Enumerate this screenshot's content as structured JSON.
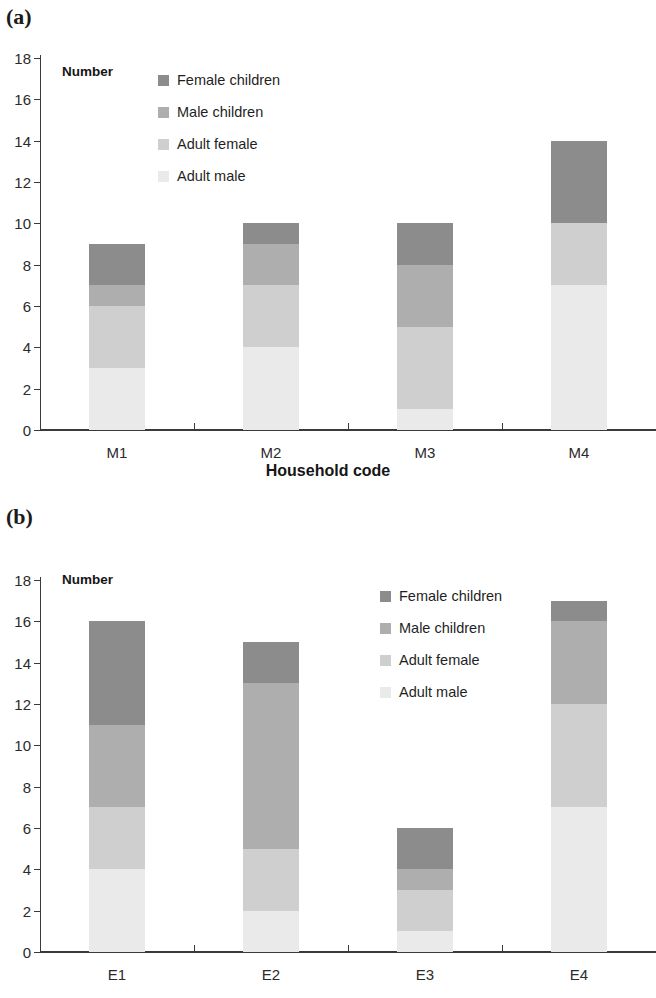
{
  "figure": {
    "panels": [
      {
        "tag": "(a)",
        "axis_title": "Household code",
        "number_label": "Number"
      },
      {
        "tag": "(b)",
        "axis_title": "Household code",
        "number_label": "Number"
      }
    ],
    "legend": [
      {
        "label": "Female children",
        "color": "#8c8c8c",
        "key": "fc"
      },
      {
        "label": "Male children",
        "color": "#aeaeae",
        "key": "mc"
      },
      {
        "label": "Adult female",
        "color": "#cfcfcf",
        "key": "af"
      },
      {
        "label": "Adult male",
        "color": "#eaeaea",
        "key": "am"
      }
    ],
    "y_ticks": [
      "0",
      "2",
      "4",
      "6",
      "8",
      "10",
      "12",
      "14",
      "16",
      "18"
    ]
  },
  "chart_data": [
    {
      "type": "bar",
      "subplot": "(a)",
      "stacked": true,
      "title": "",
      "xlabel": "Household code",
      "ylabel": "Number",
      "ylim": [
        0,
        18
      ],
      "ytick_step": 2,
      "grid": false,
      "legend_position": "inside top-left",
      "categories": [
        "M1",
        "M2",
        "M3",
        "M4"
      ],
      "series": [
        {
          "name": "Adult male",
          "color": "#eaeaea",
          "values": [
            3,
            4,
            1,
            7
          ]
        },
        {
          "name": "Adult female",
          "color": "#cfcfcf",
          "values": [
            3,
            3,
            4,
            3
          ]
        },
        {
          "name": "Male children",
          "color": "#aeaeae",
          "values": [
            1,
            2,
            3,
            0
          ]
        },
        {
          "name": "Female children",
          "color": "#8c8c8c",
          "values": [
            2,
            1,
            2,
            4
          ]
        }
      ],
      "totals": [
        9,
        10,
        10,
        14
      ]
    },
    {
      "type": "bar",
      "subplot": "(b)",
      "stacked": true,
      "title": "",
      "xlabel": "Household code",
      "ylabel": "Number",
      "ylim": [
        0,
        18
      ],
      "ytick_step": 2,
      "grid": false,
      "legend_position": "inside top-right",
      "categories": [
        "E1",
        "E2",
        "E3",
        "E4"
      ],
      "series": [
        {
          "name": "Adult male",
          "color": "#eaeaea",
          "values": [
            4,
            2,
            1,
            7
          ]
        },
        {
          "name": "Adult female",
          "color": "#cfcfcf",
          "values": [
            3,
            3,
            2,
            5
          ]
        },
        {
          "name": "Male children",
          "color": "#aeaeae",
          "values": [
            4,
            8,
            1,
            4
          ]
        },
        {
          "name": "Female children",
          "color": "#8c8c8c",
          "values": [
            5,
            2,
            2,
            1
          ]
        }
      ],
      "totals": [
        16,
        15,
        6,
        17
      ]
    }
  ]
}
